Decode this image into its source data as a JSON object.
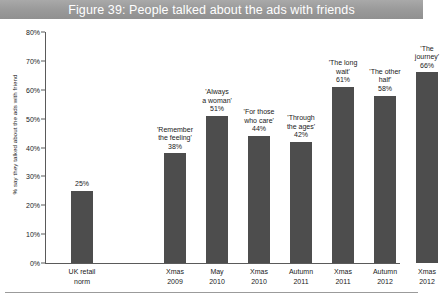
{
  "figure": {
    "title": "Figure 39: People talked about the ads with friends",
    "banner_color": "#9a9a9a",
    "bar_color": "#4d4d4d"
  },
  "chart_data": {
    "type": "bar",
    "title": "Figure 39: People talked about the ads with friends",
    "xlabel": "",
    "ylabel": "% say they talked about the ads with friend",
    "ylim": [
      0,
      80
    ],
    "ytick_labels": [
      "0%",
      "10%",
      "20%",
      "30%",
      "40%",
      "50%",
      "60%",
      "70%",
      "80%"
    ],
    "ytick_values": [
      0,
      10,
      20,
      30,
      40,
      50,
      60,
      70,
      80
    ],
    "grid": false,
    "legend": "none",
    "categories": [
      "UK retail\nnorm",
      "Xmas\n2009",
      "May\n2010",
      "Xmas\n2010",
      "Autumn\n2011",
      "Xmas\n2011",
      "Autumn\n2012",
      "Xmas\n2012"
    ],
    "category_lines": [
      [
        "UK retail",
        "norm"
      ],
      [
        "Xmas",
        "2009"
      ],
      [
        "May",
        "2010"
      ],
      [
        "Xmas",
        "2010"
      ],
      [
        "Autumn",
        "2011"
      ],
      [
        "Xmas",
        "2011"
      ],
      [
        "Autumn",
        "2012"
      ],
      [
        "Xmas",
        "2012"
      ]
    ],
    "values": [
      25,
      38,
      51,
      44,
      42,
      61,
      58,
      66
    ],
    "point_labels": [
      "25%",
      "'Remember\nthe feeling'\n38%",
      "'Always\na woman'\n51%",
      "'For those\nwho care'\n44%",
      "'Through\nthe ages'\n42%",
      "'The long\nwait'\n61%",
      "'The other\nhalf'\n58%",
      "'The\njourney'\n66%"
    ],
    "annotations": [
      {
        "campaign": "",
        "value_label": "25%",
        "lines": [
          "25%"
        ]
      },
      {
        "campaign": "'Remember the feeling'",
        "value_label": "38%",
        "lines": [
          "'Remember",
          "the feeling'",
          "38%"
        ]
      },
      {
        "campaign": "'Always a woman'",
        "value_label": "51%",
        "lines": [
          "'Always",
          "a woman'",
          "51%"
        ]
      },
      {
        "campaign": "'For those who care'",
        "value_label": "44%",
        "lines": [
          "'For those",
          "who care'",
          "44%"
        ]
      },
      {
        "campaign": "'Through the ages'",
        "value_label": "42%",
        "lines": [
          "'Through",
          "the ages'",
          "42%"
        ]
      },
      {
        "campaign": "'The long wait'",
        "value_label": "61%",
        "lines": [
          "'The long",
          "wait'",
          "61%"
        ]
      },
      {
        "campaign": "'The other half'",
        "value_label": "58%",
        "lines": [
          "'The other",
          "half'",
          "58%"
        ]
      },
      {
        "campaign": "'The journey'",
        "value_label": "66%",
        "lines": [
          "'The",
          "journey'",
          "66%"
        ]
      }
    ]
  }
}
